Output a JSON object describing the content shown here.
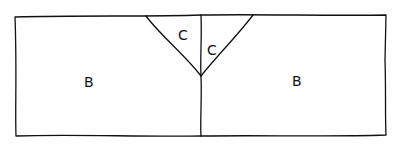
{
  "diagram": {
    "type": "hand-drawn region diagram",
    "regions": [
      {
        "id": "left-large",
        "label": "B",
        "x": 89,
        "y": 87
      },
      {
        "id": "right-large",
        "label": "B",
        "x": 297,
        "y": 86
      },
      {
        "id": "left-triangle",
        "label": "C",
        "x": 183,
        "y": 40
      },
      {
        "id": "right-triangle",
        "label": "C",
        "x": 212,
        "y": 55
      }
    ],
    "stroke_color": "#111111",
    "background_color": "#ffffff"
  }
}
